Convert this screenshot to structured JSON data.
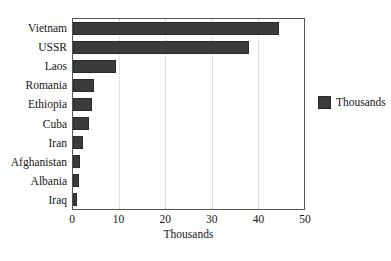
{
  "chart_data": {
    "type": "bar",
    "orientation": "horizontal",
    "title": "",
    "subtitle": "",
    "categories": [
      "Vietnam",
      "USSR",
      "Laos",
      "Romania",
      "Ethiopia",
      "Cuba",
      "Iran",
      "Afghanistan",
      "Albania",
      "Iraq"
    ],
    "values": [
      44.6,
      38.2,
      9.2,
      4.5,
      4.1,
      3.5,
      2.2,
      1.5,
      1.3,
      0.8
    ],
    "series": [
      {
        "name": "Thousands",
        "values": [
          44.6,
          38.2,
          9.2,
          4.5,
          4.1,
          3.5,
          2.2,
          1.5,
          1.3,
          0.8
        ],
        "color": "#3b3b3b"
      }
    ],
    "xlabel": "Thousands",
    "ylabel": "",
    "xlim": [
      0,
      50
    ],
    "xticks": [
      0,
      10,
      20,
      30,
      40,
      50
    ],
    "xtick_labels": [
      "0",
      "10",
      "20",
      "30",
      "40",
      "50"
    ],
    "grid": "vertical-dotted",
    "legend_position": "right",
    "legend_entries": [
      "Thousands"
    ],
    "bar_color": "#3b3b3b",
    "plot_border_color": "#555555",
    "gridline_color": "#c9c9c9",
    "background_color": "#ffffff"
  },
  "legend": {
    "label": "Thousands",
    "swatch_color": "#3b3b3b"
  },
  "axis": {
    "x_title": "Thousands"
  }
}
